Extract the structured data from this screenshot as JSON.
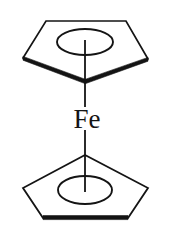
{
  "figure": {
    "kind": "chemical-structure-diagram",
    "compound_name": "Ferrocene",
    "background_color": "#ffffff",
    "stroke_color": "#141414",
    "metal_center": {
      "label": "Fe",
      "element_symbol": "Fe",
      "x": 85,
      "y": 118,
      "font_size_px": 27
    },
    "ligands": [
      {
        "name": "upper-cyclopentadienyl-ring",
        "label": "",
        "orientation": "apex-down",
        "aromatic_circle": true,
        "vertices": [
          [
            46,
            21
          ],
          [
            126,
            21
          ],
          [
            148,
            59
          ],
          [
            85,
            82
          ],
          [
            23,
            58
          ]
        ],
        "bold_edges": [
          [
            [
              23,
              58
            ],
            [
              85,
              82
            ]
          ],
          [
            [
              85,
              82
            ],
            [
              148,
              59
            ]
          ]
        ],
        "ellipse": {
          "cx": 85,
          "cy": 42,
          "rx": 28,
          "ry": 13
        }
      },
      {
        "name": "lower-cyclopentadienyl-ring",
        "label": "",
        "orientation": "apex-up",
        "aromatic_circle": true,
        "vertices": [
          [
            85,
            155
          ],
          [
            148,
            188
          ],
          [
            128,
            218
          ],
          [
            43,
            218
          ],
          [
            23,
            188
          ]
        ],
        "bold_edges": [
          [
            [
              43,
              218
            ],
            [
              128,
              218
            ]
          ]
        ],
        "ellipse": {
          "cx": 85,
          "cy": 190,
          "rx": 27,
          "ry": 14
        }
      }
    ],
    "bonds": [
      {
        "name": "upper-metal-ligand-bond",
        "from": [
          85,
          82
        ],
        "to": [
          85,
          108
        ],
        "style": "line"
      },
      {
        "name": "lower-metal-ligand-bond",
        "from": [
          85,
          129
        ],
        "to": [
          85,
          155
        ],
        "style": "line"
      },
      {
        "name": "upper-ring-centroid-bond",
        "from": [
          85,
          42
        ],
        "to": [
          85,
          82
        ],
        "style": "line"
      },
      {
        "name": "lower-ring-centroid-bond",
        "from": [
          85,
          155
        ],
        "to": [
          85,
          190
        ],
        "style": "line"
      }
    ]
  }
}
